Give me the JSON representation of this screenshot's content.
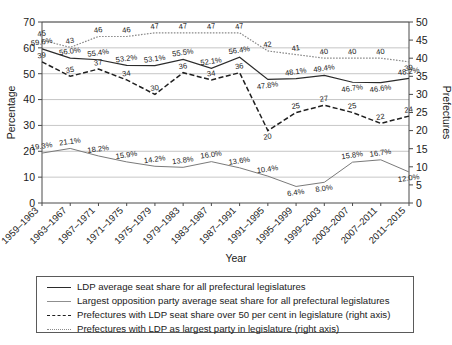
{
  "chart_data": {
    "type": "line",
    "title": "",
    "xlabel": "Year",
    "ylabel": "Percentage",
    "y2label": "Prefectures",
    "ylim": [
      0,
      70
    ],
    "y2lim": [
      0,
      50
    ],
    "grid": true,
    "legend_position": "below-plot",
    "categories": [
      "1959–1963",
      "1963–1967",
      "1967–1971",
      "1971–1975",
      "1975–1979",
      "1979–1983",
      "1983–1987",
      "1987–1991",
      "1991–1995",
      "1995–1999",
      "1999–2003",
      "2003–2007",
      "2007–2011",
      "2011–2015"
    ],
    "yticks": [
      0,
      10,
      20,
      30,
      40,
      50,
      60,
      70
    ],
    "y2ticks": [
      0,
      5,
      10,
      15,
      20,
      25,
      30,
      35,
      40,
      45,
      50
    ],
    "series": [
      {
        "name": "LDP average seat share for all prefectural legislatures",
        "axis": "left",
        "style": "solid",
        "color": "#2b2b2b",
        "values": [
          59.6,
          56.0,
          55.4,
          53.2,
          53.1,
          55.5,
          52.1,
          56.4,
          47.8,
          48.1,
          49.4,
          46.7,
          46.6,
          48.2
        ],
        "labels": [
          "59.6%",
          "56.0%",
          "55.4%",
          "53.2%",
          "53.1%",
          "55.5%",
          "52.1%",
          "56.4%",
          "47.8%",
          "48.1%",
          "49.4%",
          "46.7%",
          "46.6%",
          "48.2%"
        ]
      },
      {
        "name": "Largest opposition party average seat share for all prefectural legislatures",
        "axis": "left",
        "style": "thin-solid",
        "color": "#7a7a7a",
        "values": [
          19.3,
          21.1,
          18.2,
          15.9,
          14.2,
          13.8,
          16.0,
          13.6,
          10.4,
          6.4,
          8.0,
          15.8,
          16.7,
          12.0
        ],
        "labels": [
          "19.3%",
          "21.1%",
          "18.2%",
          "15.9%",
          "14.2%",
          "13.8%",
          "16.0%",
          "13.6%",
          "10.4%",
          "6.4%",
          "8.0%",
          "15.8%",
          "16.7%",
          "12.0%"
        ]
      },
      {
        "name": "Prefectures with LDP seat share over 50 per cent in legislature (right axis)",
        "axis": "right",
        "style": "dashed",
        "color": "#1f1f1f",
        "values": [
          39,
          35,
          37,
          34,
          30,
          36,
          34,
          36,
          20,
          25,
          27,
          25,
          22,
          24
        ],
        "labels": [
          "39",
          "35",
          "37",
          "34",
          "30",
          "36",
          "34",
          "36",
          "20",
          "25",
          "27",
          "25",
          "22",
          "24"
        ]
      },
      {
        "name": "Prefectures with LDP as largest party in legislature (right axis)",
        "axis": "right",
        "style": "dotted",
        "color": "#8a8a8a",
        "values": [
          45,
          43,
          46,
          46,
          47,
          47,
          47,
          47,
          42,
          41,
          40,
          40,
          40,
          39
        ],
        "labels": [
          "45",
          "43",
          "46",
          "46",
          "47",
          "47",
          "47",
          "47",
          "42",
          "41",
          "40",
          "40",
          "40",
          "39"
        ]
      }
    ]
  },
  "legend": {
    "items": [
      {
        "label": "LDP average seat share for all prefectural legislatures",
        "swatch": "sw-ldp"
      },
      {
        "label": "Largest opposition party average seat share for all prefectural legislatures",
        "swatch": "sw-opp"
      },
      {
        "label": "Prefectures with LDP seat share over 50 per cent in legislature (right axis)",
        "swatch": "sw-over50"
      },
      {
        "label": "Prefectures with LDP as largest party in legislature (right axis)",
        "swatch": "sw-largest"
      }
    ]
  }
}
